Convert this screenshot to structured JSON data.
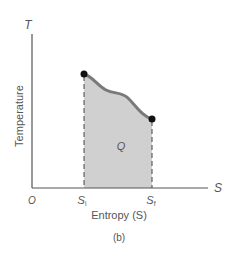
{
  "figure": {
    "caption": "(b)",
    "y_axis_symbol": "T",
    "y_axis_label": "Temperature",
    "x_axis_symbol": "S",
    "x_axis_label": "Entropy (S)",
    "origin_label": "O",
    "initial_label": "S",
    "initial_sub": "i",
    "final_label": "S",
    "final_sub": "f",
    "area_label": "Q",
    "colors": {
      "area_fill": "#d0d0d0",
      "curve": "#7a7a7a",
      "axis": "#555555",
      "points": "#111111"
    }
  }
}
